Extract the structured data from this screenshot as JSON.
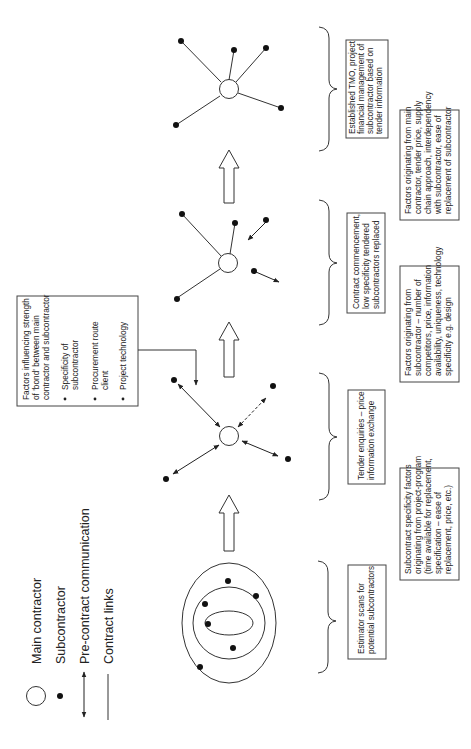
{
  "legend": {
    "items": [
      {
        "symbol": "open-circle",
        "label": "Main contractor"
      },
      {
        "symbol": "filled-dot",
        "label": "Subcontractor"
      },
      {
        "symbol": "double-arrow",
        "label": "Pre-contract communication"
      },
      {
        "symbol": "solid-line",
        "label": "Contract links"
      }
    ]
  },
  "influence_box": {
    "title_lines": [
      "Factors influencing strength",
      "of 'bond' between main",
      "contractor and subcontractor"
    ],
    "bullets": [
      [
        "Specificity of",
        "subcontractor"
      ],
      [
        "Procurement route",
        "client"
      ],
      [
        "Project technology"
      ]
    ]
  },
  "stages": [
    {
      "id": "stage-1",
      "description_lines": [
        "Estimator scans for",
        "potential subcontractors"
      ],
      "factors_lines": [
        "Subcontract specificity factors",
        "originating from project-program",
        "(time available for replacement,",
        "specification – ease of",
        "replacement, price, etc.)"
      ]
    },
    {
      "id": "stage-2",
      "description_lines": [
        "Tender enquiries – price",
        "information exchange"
      ],
      "factors_lines": [
        "Factors originating from",
        "subcontractor – number of",
        "competitors, price, information",
        "availability, uniqueness, technology",
        "specificity e.g. design"
      ]
    },
    {
      "id": "stage-3",
      "description_lines": [
        "Contract commencement,",
        "low specificity tendered",
        "subcontractors replaced"
      ],
      "factors_lines": [
        "Factors originating from main",
        "contractor, tender price, supply",
        "chain approach, interdependency",
        "with subcontractor, ease of",
        "replacement of subcontractor"
      ]
    },
    {
      "id": "stage-4",
      "description_lines": [
        "Established TMO, project",
        "financial management of",
        "subcontractor based on",
        "tender information"
      ],
      "factors_lines": []
    }
  ],
  "colors": {
    "stroke": "#333333",
    "fill_dot": "#111111",
    "box_border": "#444444"
  }
}
